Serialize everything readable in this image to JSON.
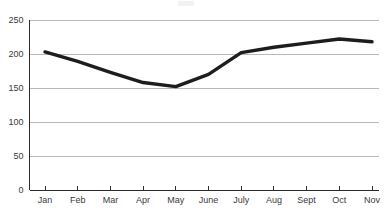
{
  "chart_data": {
    "type": "line",
    "title": "",
    "subtitle": "",
    "xlabel": "",
    "ylabel": "",
    "categories": [
      "Jan",
      "Feb",
      "Mar",
      "Apr",
      "May",
      "June",
      "July",
      "Aug",
      "Sept",
      "Oct",
      "Nov"
    ],
    "values": [
      203,
      189,
      173,
      158,
      152,
      170,
      202,
      210,
      216,
      222,
      218
    ],
    "series": [
      {
        "name": "",
        "values": [
          203,
          189,
          173,
          158,
          152,
          170,
          202,
          210,
          216,
          222,
          218
        ]
      }
    ],
    "ylim": [
      0,
      250
    ],
    "y_ticks": [
      0,
      50,
      100,
      150,
      200,
      250
    ],
    "y_tick_labels": [
      "0",
      "50",
      "100",
      "150",
      "200",
      "250"
    ],
    "grid": true,
    "grid_axis": "y",
    "legend": false,
    "legend_position": "none",
    "markers": false,
    "annotations": []
  },
  "style": {
    "line_color": "#1d1d1d",
    "grid_color": "#a8a8a8",
    "axis_color": "#2b2b2b",
    "text_color": "#3a3a3a",
    "background": "#ffffff"
  },
  "axis": {
    "y_labels": [
      "250",
      "200",
      "150",
      "100",
      "50",
      "0"
    ],
    "x_labels": [
      "Jan",
      "Feb",
      "Mar",
      "Apr",
      "May",
      "June",
      "July",
      "Aug",
      "Sept",
      "Oct",
      "Nov"
    ]
  }
}
